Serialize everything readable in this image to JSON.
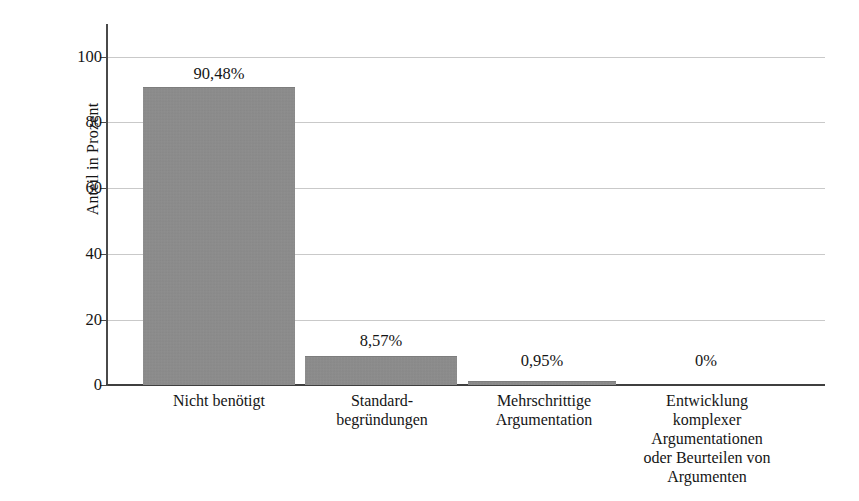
{
  "chart_data": {
    "type": "bar",
    "title": "",
    "subtitle": "",
    "xlabel": "",
    "ylabel": "Anteil in Prozent",
    "ylim": [
      0,
      100
    ],
    "yticks": [
      0,
      20,
      40,
      60,
      80,
      100
    ],
    "ytick_labels": [
      "0",
      "20",
      "40",
      "60",
      "80",
      "100"
    ],
    "grid": "horizontal",
    "legend": "none",
    "bar_color": "#8c8c8c",
    "categories": [
      "Nicht benötigt",
      "Standard-\nbegründungen",
      "Mehrschrittige\nArgumentation",
      "Entwicklung\nkomplexer\nArgumentationen\noder Beurteilen von\nArgumenten"
    ],
    "category_lines": [
      [
        "Nicht benötigt"
      ],
      [
        "Standard-",
        "begründungen"
      ],
      [
        "Mehrschrittige",
        "Argumentation"
      ],
      [
        "Entwicklung",
        "komplexer",
        "Argumentationen",
        "oder Beurteilen von",
        "Argumenten"
      ]
    ],
    "values": [
      90.48,
      8.57,
      0.95,
      0
    ],
    "data_labels": [
      "90,48%",
      "8,57%",
      "0,95%",
      "0%"
    ]
  }
}
